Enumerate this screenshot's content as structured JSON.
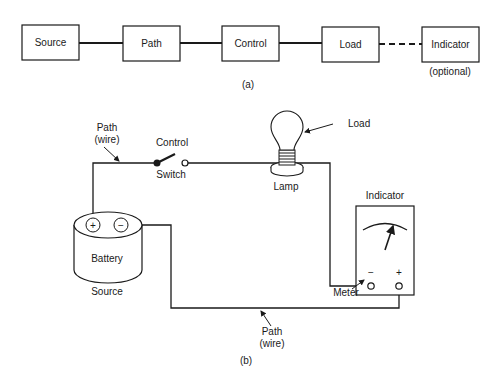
{
  "part_a": {
    "caption": "(a)",
    "blocks": [
      {
        "id": "source",
        "label": "Source"
      },
      {
        "id": "path",
        "label": "Path"
      },
      {
        "id": "control",
        "label": "Control"
      },
      {
        "id": "load",
        "label": "Load"
      },
      {
        "id": "indicator",
        "label": "Indicator"
      }
    ],
    "indicator_note": "(optional)",
    "connections": [
      {
        "from": "source",
        "to": "path",
        "style": "solid"
      },
      {
        "from": "path",
        "to": "control",
        "style": "solid"
      },
      {
        "from": "control",
        "to": "load",
        "style": "solid"
      },
      {
        "from": "load",
        "to": "indicator",
        "style": "dashed"
      }
    ]
  },
  "part_b": {
    "caption": "(b)",
    "path_top_label_1": "Path",
    "path_top_label_2": "(wire)",
    "control_label": "Control",
    "switch_label": "Switch",
    "load_label": "Load",
    "lamp_label": "Lamp",
    "battery_label": "Battery",
    "battery_plus": "+",
    "battery_minus": "−",
    "source_label": "Source",
    "indicator_label": "Indicator",
    "meter_minus": "−",
    "meter_plus": "+",
    "meter_label": "Meter",
    "path_bottom_label_1": "Path",
    "path_bottom_label_2": "(wire)"
  }
}
